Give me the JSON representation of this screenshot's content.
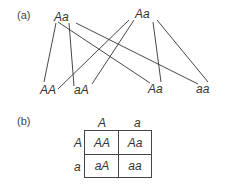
{
  "panel_a": {
    "label": "(a)",
    "parents": [
      {
        "genotype": "Aa"
      },
      {
        "genotype": "Aa"
      }
    ],
    "offspring": [
      {
        "genotype": "AA"
      },
      {
        "genotype": "aA"
      },
      {
        "genotype": "Aa"
      },
      {
        "genotype": "aa"
      }
    ]
  },
  "panel_b": {
    "label": "(b)",
    "column_headers": [
      "A",
      "a"
    ],
    "row_headers": [
      "A",
      "a"
    ],
    "cells": [
      [
        "AA",
        "Aa"
      ],
      [
        "aA",
        "aa"
      ]
    ]
  },
  "colors": {
    "line": "#333333",
    "text": "#333333"
  }
}
